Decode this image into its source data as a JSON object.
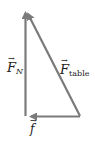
{
  "diagram": {
    "type": "vector-triangle",
    "colors": {
      "vector": "#7a7a7a",
      "text": "#222222",
      "background": "#ffffff"
    },
    "vectors": [
      {
        "id": "normal-force",
        "symbol": "F",
        "subscript": "N",
        "direction": "up",
        "label": "F_N"
      },
      {
        "id": "table-force",
        "symbol": "F",
        "subscript": "table",
        "direction": "up-left",
        "label": "F_table"
      },
      {
        "id": "friction",
        "symbol": "f",
        "subscript": "",
        "direction": "left",
        "label": "f"
      }
    ],
    "labels": {
      "fn_symbol": "F",
      "fn_sub": "N",
      "ftable_symbol": "F",
      "ftable_sub": "table",
      "f_symbol": "f",
      "arrow": "→"
    }
  }
}
